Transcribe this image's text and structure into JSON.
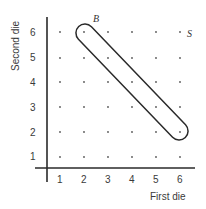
{
  "diagram": {
    "x_axis_label": "First die",
    "y_axis_label": "Second die",
    "x_ticks": [
      "1",
      "2",
      "3",
      "4",
      "5",
      "6"
    ],
    "y_ticks": [
      "1",
      "2",
      "3",
      "4",
      "5",
      "6"
    ],
    "sample_space_label": "S",
    "event_label": "B",
    "event_points": [
      [
        2,
        6
      ],
      [
        3,
        5
      ],
      [
        4,
        4
      ],
      [
        5,
        3
      ],
      [
        6,
        2
      ]
    ],
    "grid": {
      "columns": 6,
      "rows": 6
    },
    "colors": {
      "ink": "#2a2a2a",
      "dot": "#555555"
    }
  }
}
